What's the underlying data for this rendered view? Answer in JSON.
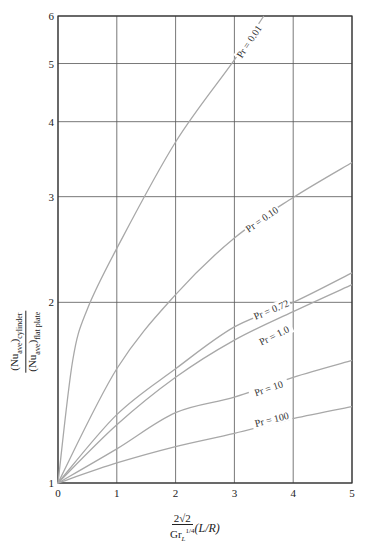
{
  "chart_data": {
    "type": "line",
    "title": "",
    "xlabel": "2√2 / Gr_L^{1/4} (L/R)",
    "xlabel_parts": {
      "num": "2√2",
      "den_main": "Gr",
      "den_sub": "L",
      "den_sup": "1/4",
      "paren": "(L/R)"
    },
    "ylabel": "(Nu_ave)_cylinder / (Nu_ave)_flat plate",
    "ylabel_parts": {
      "num": "(Nu",
      "num_sub": "ave",
      "num_tail": ")",
      "num_sub2": "cylinder",
      "den": "(Nu",
      "den_sub": "ave",
      "den_tail": ")",
      "den_sub2": "flat plate"
    },
    "x_ticks": [
      "0",
      "1",
      "2",
      "3",
      "4",
      "5"
    ],
    "y_ticks": [
      "1",
      "2",
      "3",
      "4",
      "5",
      "6"
    ],
    "xlim": [
      0,
      5
    ],
    "ylim": [
      1,
      6
    ],
    "y_scale": "log",
    "grid": true,
    "legend": "inline curve labels",
    "x": [
      0,
      1,
      2,
      3,
      4,
      5
    ],
    "series": [
      {
        "name": "Pr = 0.01",
        "values": [
          1.0,
          2.46,
          3.7,
          5.07,
          null,
          null
        ],
        "extra_points": [
          [
            0.25,
            1.6
          ],
          [
            0.5,
            1.95
          ],
          [
            3.5,
            6.0
          ]
        ],
        "label_pos": [
          3.3,
          5.4
        ]
      },
      {
        "name": "Pr = 0.10",
        "values": [
          1.0,
          1.55,
          2.06,
          2.56,
          2.99,
          3.42
        ],
        "label_pos": [
          3.5,
          2.72
        ]
      },
      {
        "name": "Pr = 0.72",
        "values": [
          1.0,
          1.3,
          1.55,
          1.82,
          2.0,
          2.24
        ],
        "label_pos": [
          3.65,
          1.92
        ]
      },
      {
        "name": "Pr = 1.0",
        "values": [
          1.0,
          1.25,
          1.5,
          1.73,
          1.93,
          2.14
        ],
        "label_pos": [
          3.7,
          1.74
        ]
      },
      {
        "name": "Pr = 10",
        "values": [
          1.0,
          1.14,
          1.31,
          1.39,
          1.5,
          1.6
        ],
        "label_pos": [
          3.6,
          1.42
        ]
      },
      {
        "name": "Pr = 100",
        "values": [
          1.0,
          1.08,
          1.15,
          1.21,
          1.28,
          1.34
        ],
        "label_pos": [
          3.65,
          1.26
        ]
      }
    ],
    "colors": {
      "grid": "#555555",
      "curve": "#a8a8a8",
      "axis": "#333333"
    }
  }
}
